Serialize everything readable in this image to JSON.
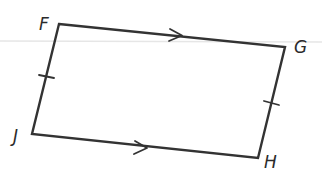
{
  "figure": {
    "type": "parallelogram",
    "colors": {
      "stroke": "#333333",
      "label": "#2b2b2b",
      "guide_line": "#e4e4e4",
      "background": "#ffffff"
    },
    "vertices": {
      "F": {
        "label": "F",
        "x": 59,
        "y": 24
      },
      "G": {
        "label": "G",
        "x": 285,
        "y": 47
      },
      "H": {
        "label": "H",
        "x": 258,
        "y": 158
      },
      "J": {
        "label": "J",
        "x": 32,
        "y": 134
      }
    },
    "edges": [
      {
        "from": "F",
        "to": "G",
        "marking": "parallel-arrow"
      },
      {
        "from": "G",
        "to": "H",
        "marking": "congruence-tick"
      },
      {
        "from": "H",
        "to": "J",
        "marking": "parallel-arrow"
      },
      {
        "from": "J",
        "to": "F",
        "marking": "congruence-tick"
      }
    ],
    "labels": {
      "F": "F",
      "G": "G",
      "H": "H",
      "J": "J"
    }
  }
}
